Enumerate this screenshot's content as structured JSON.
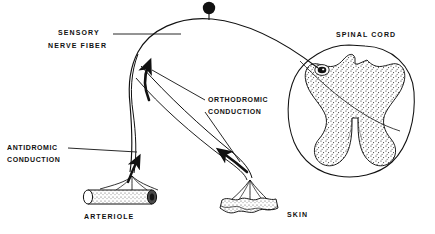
{
  "figure": {
    "type": "anatomical-diagram",
    "background_color": "#ffffff",
    "ink_color": "#111111",
    "width": 435,
    "height": 234
  },
  "labels": {
    "sensory_line1": "SENSORY",
    "sensory_line2": "NERVE  FIBER",
    "orthodromic_line1": "ORTHODROMIC",
    "orthodromic_line2": "CONDUCTION",
    "antidromic_line1": "ANTIDROMIC",
    "antidromic_line2": "CONDUCTION",
    "spinal_cord": "SPINAL CORD",
    "arteriole": "ARTERIOLE",
    "skin": "SKIN"
  },
  "structures": [
    {
      "name": "spinal-cord",
      "label": "SPINAL CORD",
      "description": "Cross-section of spinal cord with butterfly-shaped stippled gray matter and dorsal horn cell body"
    },
    {
      "name": "dorsal-root-ganglion-cell",
      "label": "",
      "description": "Black filled cell body on a short stalk atop the nerve fiber arc"
    },
    {
      "name": "arteriole",
      "label": "ARTERIOLE",
      "description": "Horizontal stippled cylindrical vessel receiving fanned nerve terminals"
    },
    {
      "name": "skin",
      "label": "SKIN",
      "description": "Stippled irregular epidermal surface receiving fanned nerve terminals"
    }
  ],
  "arrows": [
    {
      "name": "antidromic-arrow",
      "direction": "toward arteriole branch, pointing up along left branch",
      "label": "ANTIDROMIC CONDUCTION"
    },
    {
      "name": "orthodromic-arrow",
      "direction": "toward spinal cord, pointing up-left along right branch",
      "label": "ORTHODROMIC CONDUCTION"
    }
  ]
}
